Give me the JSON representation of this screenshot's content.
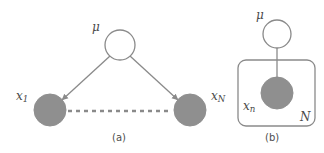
{
  "figure": {
    "type": "graphical-model-diagram",
    "colors": {
      "background": "#ffffff",
      "node_observed_fill": "#8f8f8f",
      "node_latent_fill": "#ffffff",
      "stroke": "#8a8a8a",
      "plate_stroke": "#8a8a8a",
      "text": "#4a4a4a",
      "caption_text": "#4d4d4d"
    },
    "panels": [
      {
        "id": "a",
        "caption": "(a)",
        "caption_x": 112,
        "caption_y": 133,
        "nodes": [
          {
            "name": "mu-node",
            "label": "μ",
            "label_sub": "",
            "shaded": false,
            "cx": 120,
            "cy": 45,
            "r": 15,
            "label_x": 92,
            "label_y": 21
          },
          {
            "name": "x1-node",
            "label": "x",
            "label_sub": "1",
            "shaded": true,
            "cx": 50,
            "cy": 110,
            "r": 16,
            "label_x": 16,
            "label_y": 90
          },
          {
            "name": "xn-node",
            "label": "x",
            "label_sub": "N",
            "shaded": true,
            "cx": 190,
            "cy": 110,
            "r": 16,
            "label_x": 211,
            "label_y": 90
          }
        ],
        "edges": [
          {
            "name": "edge-mu-to-x1",
            "from": "mu-node",
            "to": "x1-node",
            "style": "arrow"
          },
          {
            "name": "edge-mu-to-xn",
            "from": "mu-node",
            "to": "xn-node",
            "style": "arrow"
          },
          {
            "name": "ellipsis-x1-to-xn",
            "from": "x1-node",
            "to": "xn-node",
            "style": "dashed"
          }
        ]
      },
      {
        "id": "b",
        "caption": "(b)",
        "caption_x": 265,
        "caption_y": 133,
        "nodes": [
          {
            "name": "mu-node-plate",
            "label": "μ",
            "label_sub": "",
            "shaded": false,
            "cx": 277,
            "cy": 34,
            "r": 14,
            "label_x": 256,
            "label_y": 9
          },
          {
            "name": "xn-node-plate",
            "label": "x",
            "label_sub": "n",
            "shaded": true,
            "cx": 277,
            "cy": 93,
            "r": 16,
            "label_x": 243,
            "label_y": 100
          }
        ],
        "edges": [
          {
            "name": "edge-mu-to-xn-plate",
            "from": "mu-node-plate",
            "to": "xn-node-plate",
            "style": "arrow"
          }
        ],
        "plate": {
          "name": "plate-box",
          "label": "N",
          "x": 238,
          "y": 60,
          "width": 77,
          "height": 66,
          "rx": 8,
          "label_x": 300,
          "label_y": 111
        }
      }
    ]
  }
}
